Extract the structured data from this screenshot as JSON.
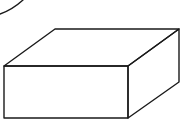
{
  "diagram": {
    "title": "Rectangular prism (box) line drawing",
    "shape": "rectangular-prism",
    "stroke_color": "#1a1a1a",
    "background_color": "#ffffff",
    "vertices": {
      "front_top_left": [
        4,
        66
      ],
      "front_top_right": [
        128,
        66
      ],
      "front_bottom_left": [
        4,
        118
      ],
      "front_bottom_right": [
        128,
        118
      ],
      "back_top_left": [
        55,
        29
      ],
      "back_top_right": [
        179,
        29
      ],
      "back_bottom_right": [
        179,
        82
      ]
    },
    "partial_arc": {
      "start": [
        0,
        14
      ],
      "control": [
        12,
        10
      ],
      "end": [
        23,
        0
      ]
    }
  }
}
